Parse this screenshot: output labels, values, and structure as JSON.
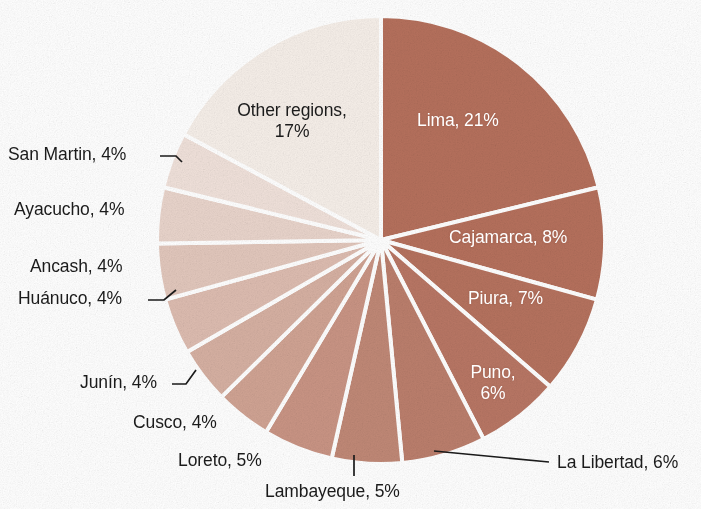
{
  "chart_data": {
    "type": "pie",
    "title": "",
    "subtitle": "",
    "legend_position": "labels-on-slices",
    "grid": false,
    "unit": "%",
    "total": 100,
    "start_angle_deg": 0,
    "direction": "clockwise",
    "categories": [
      "Lima",
      "Cajamarca",
      "Piura",
      "Puno",
      "La Libertad",
      "Lambayeque",
      "Loreto",
      "Cusco",
      "Junín",
      "Huánuco",
      "Ancash",
      "Ayacucho",
      "San Martin",
      "Other regions"
    ],
    "values": [
      21,
      8,
      7,
      6,
      6,
      5,
      5,
      4,
      4,
      4,
      4,
      4,
      4,
      17
    ],
    "colors": [
      "#b5705c",
      "#b5705c",
      "#b5725e",
      "#b87664",
      "#bb7e6c",
      "#c08876",
      "#c99484",
      "#d0a393",
      "#d6b0a2",
      "#ddbcb0",
      "#e2c7bc",
      "#e9d4cb",
      "#f0e1da",
      "#f6efe9"
    ],
    "slice_labels": [
      {
        "name": "Lima",
        "text": "Lima, 21%",
        "placement": "inside"
      },
      {
        "name": "Cajamarca",
        "text": "Cajamarca, 8%",
        "placement": "inside"
      },
      {
        "name": "Piura",
        "text": "Piura, 7%",
        "placement": "inside"
      },
      {
        "name": "Puno",
        "text_line1": "Puno,",
        "text_line2": "6%",
        "placement": "inside"
      },
      {
        "name": "La Libertad",
        "text": "La Libertad, 6%",
        "placement": "outside"
      },
      {
        "name": "Lambayeque",
        "text": "Lambayeque, 5%",
        "placement": "outside"
      },
      {
        "name": "Loreto",
        "text": "Loreto, 5%",
        "placement": "outside"
      },
      {
        "name": "Cusco",
        "text": "Cusco, 4%",
        "placement": "outside"
      },
      {
        "name": "Junín",
        "text": "Junín, 4%",
        "placement": "outside"
      },
      {
        "name": "Huánuco",
        "text": "Huánuco, 4%",
        "placement": "outside"
      },
      {
        "name": "Ancash",
        "text": "Ancash, 4%",
        "placement": "outside"
      },
      {
        "name": "Ayacucho",
        "text": "Ayacucho, 4%",
        "placement": "outside"
      },
      {
        "name": "San Martin",
        "text": "San Martin, 4%",
        "placement": "outside"
      },
      {
        "name": "Other regions",
        "text_line1": "Other regions,",
        "text_line2": "17%",
        "placement": "outside"
      }
    ]
  },
  "labels": {
    "lima": "Lima, 21%",
    "cajamarca": "Cajamarca, 8%",
    "piura": "Piura, 7%",
    "puno_line1": "Puno,",
    "puno_line2": "6%",
    "la_libertad": "La Libertad, 6%",
    "lambayeque": "Lambayeque, 5%",
    "loreto": "Loreto, 5%",
    "cusco": "Cusco, 4%",
    "junin": "Junín, 4%",
    "huanuco": "Huánuco, 4%",
    "ancash": "Ancash, 4%",
    "ayacucho": "Ayacucho, 4%",
    "san_martin": "San Martin, 4%",
    "other_regions_line1": "Other regions,",
    "other_regions_line2": "17%"
  },
  "style": {
    "background": "#ffffff",
    "text_color": "#1b1b1b",
    "inside_text_color": "#ffffff",
    "slice_border": "#ffffff",
    "darkest_slice": "#b5705c",
    "lightest_slice": "#f6efe9"
  }
}
